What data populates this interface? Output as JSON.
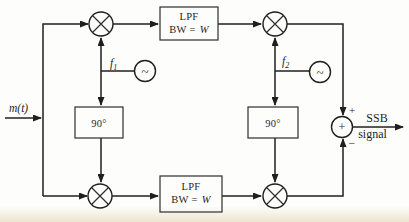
{
  "figure": {
    "input": {
      "label": "m(t)"
    },
    "output": {
      "label_line1": "SSB",
      "label_line2": "signal"
    },
    "filters": {
      "top": {
        "name": "LPF",
        "bw_prefix": "BW =",
        "bw_value": "W"
      },
      "bottom": {
        "name": "LPF",
        "bw_prefix": "BW =",
        "bw_value": "W"
      }
    },
    "phase_shifters": {
      "left": {
        "label": "90°"
      },
      "right": {
        "label": "90°"
      }
    },
    "oscillators": {
      "left": {
        "name": "f",
        "sub": "1",
        "symbol": "~"
      },
      "right": {
        "name": "f",
        "sub": "2",
        "symbol": "~"
      }
    },
    "summer": {
      "symbol": "+",
      "top_sign": "+",
      "bottom_sign": "−"
    },
    "colors": {
      "ink": "#1f1f1f",
      "background": "#fdfdfb"
    }
  }
}
